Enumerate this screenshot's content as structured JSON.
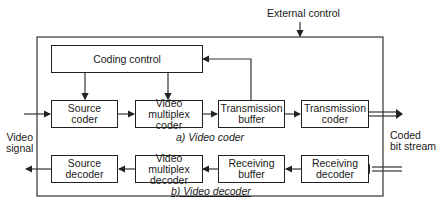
{
  "diagram": {
    "external_control": "External control",
    "coding_control": "Coding control",
    "coder": {
      "caption": "a) Video coder",
      "blocks": [
        "Source\ncoder",
        "Video multiplex\ncoder",
        "Transmission\nbuffer",
        "Transmission\ncoder"
      ]
    },
    "decoder": {
      "caption": "b) Video decoder",
      "blocks": [
        "Source\ndecoder",
        "Video multiplex\ndecoder",
        "Receiving\nbuffer",
        "Receiving\ndecoder"
      ]
    },
    "video_signal": "Video\nsignal",
    "coded_bit_stream": "Coded\nbit stream"
  }
}
